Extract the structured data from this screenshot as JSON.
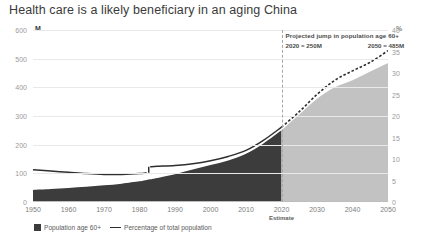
{
  "title": "Health care is a likely beneficiary in an aging China",
  "axis": {
    "left_unit": "M",
    "right_unit": "%",
    "left_ticks": [
      0,
      100,
      200,
      300,
      400,
      500,
      600
    ],
    "right_ticks": [
      0,
      5,
      10,
      15,
      20,
      25,
      30,
      35,
      40
    ],
    "x_ticks": [
      1950,
      1960,
      1970,
      1980,
      1990,
      2000,
      2010,
      2020,
      2030,
      2040,
      2050
    ]
  },
  "annotation": {
    "headline": "Projected jump in population age 60+",
    "value_1": "2020 = 250M",
    "value_2": "2050 = 485M"
  },
  "estimate_label": "Estimate",
  "legend": [
    {
      "label": "Population age 60+",
      "marker": "area-swatch"
    },
    {
      "label": "Percentage of total population",
      "marker": "line-swatch"
    }
  ],
  "colors": {
    "area_historical": "#3c3c3c",
    "area_forecast": "#c2c2c2",
    "line": "#2e2e2e",
    "grid": "#e9e9e9",
    "divider": "#a8a8a8"
  },
  "chart_data": {
    "type": "area",
    "title": "Health care is a likely beneficiary in an aging China",
    "xlabel": "",
    "ylabel": "Population age 60+ (M)",
    "y2label": "Percentage of total population (%)",
    "xlim": [
      1950,
      2050
    ],
    "ylim": [
      0,
      600
    ],
    "y2lim": [
      0,
      40
    ],
    "grid": true,
    "legend_position": "bottom-left",
    "forecast_start": 2020,
    "annotations": [
      {
        "text": "Projected jump in population age 60+",
        "x": 2021,
        "y": 575
      },
      {
        "text": "2020 = 250M",
        "x": 2021,
        "y": 545
      },
      {
        "text": "2050 = 485M",
        "x": 2036,
        "y": 545
      },
      {
        "text": "Estimate",
        "x": 2020,
        "y": -30
      }
    ],
    "x": [
      1950,
      1955,
      1960,
      1965,
      1970,
      1975,
      1980,
      1982,
      1983,
      1985,
      1990,
      1995,
      2000,
      2005,
      2010,
      2015,
      2020,
      2025,
      2030,
      2035,
      2040,
      2045,
      2050
    ],
    "series": [
      {
        "name": "Population age 60+",
        "unit": "M",
        "axis": "left",
        "type": "area",
        "values": [
          42,
          45,
          49,
          53,
          58,
          64,
          72,
          77,
          79,
          84,
          97,
          113,
          129,
          145,
          168,
          205,
          250,
          305,
          360,
          400,
          425,
          455,
          485
        ]
      },
      {
        "name": "Percentage of total population",
        "unit": "%",
        "axis": "right",
        "type": "line",
        "values": [
          7.5,
          7.2,
          6.9,
          6.6,
          6.4,
          6.4,
          6.6,
          6.8,
          8.2,
          8.3,
          8.5,
          8.9,
          9.6,
          10.6,
          12.0,
          14.4,
          17.4,
          21.0,
          25.0,
          28.3,
          30.5,
          32.5,
          35.2
        ]
      }
    ]
  }
}
